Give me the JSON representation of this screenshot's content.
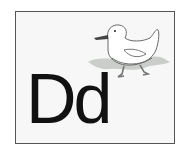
{
  "card": {
    "letters": "Dd",
    "illustration": "duck-icon",
    "colors": {
      "background": "#f7f7f7",
      "border": "#555555",
      "letter": "#111111",
      "duck_body": "#ffffff",
      "duck_outline": "#666666",
      "duck_bill": "#444444",
      "water": "#b9bcb8"
    }
  }
}
